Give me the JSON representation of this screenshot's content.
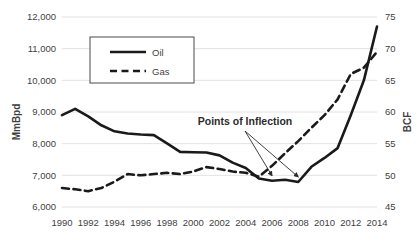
{
  "chart_data": {
    "type": "line",
    "title": "",
    "xlabel": "",
    "ylabel": "MmBpd",
    "y2label": "BCF",
    "grid": "horizontal",
    "legend_position": "upper-left-inside",
    "x": [
      1990,
      1991,
      1992,
      1993,
      1994,
      1995,
      1996,
      1997,
      1998,
      1999,
      2000,
      2001,
      2002,
      2003,
      2004,
      2005,
      2006,
      2007,
      2008,
      2009,
      2010,
      2011,
      2012,
      2013,
      2014
    ],
    "xticks": [
      "1990",
      "1992",
      "1994",
      "1996",
      "1998",
      "2000",
      "2002",
      "2004",
      "2006",
      "2008",
      "2010",
      "2012",
      "2014"
    ],
    "xlim": [
      1990,
      2014
    ],
    "ylim": [
      6000,
      12000
    ],
    "yticks": [
      "6,000",
      "7,000",
      "8,000",
      "9,000",
      "10,000",
      "11,000",
      "12,000"
    ],
    "y2lim": [
      45,
      75
    ],
    "y2ticks": [
      "45",
      "50",
      "55",
      "60",
      "65",
      "70",
      "75"
    ],
    "series": [
      {
        "name": "Oil",
        "style": "solid",
        "axis": "left",
        "color": "#1a1a1a",
        "values": [
          8900,
          9100,
          8860,
          8580,
          8390,
          8320,
          8290,
          8270,
          8010,
          7740,
          7730,
          7720,
          7630,
          7400,
          7230,
          6900,
          6830,
          6860,
          6790,
          7270,
          7550,
          7860,
          8900,
          10000,
          11700
        ]
      },
      {
        "name": "Gas",
        "style": "dashed",
        "axis": "right",
        "color": "#1a1a1a",
        "values": [
          48.0,
          47.8,
          47.5,
          48.0,
          49.0,
          50.2,
          50.0,
          50.2,
          50.4,
          50.2,
          50.6,
          51.3,
          51.0,
          50.6,
          50.4,
          49.8,
          51.5,
          53.5,
          55.4,
          57.5,
          59.5,
          62.0,
          66.0,
          67.0,
          69.5
        ]
      }
    ],
    "annotations": [
      {
        "text": "Points of Inflection",
        "points": [
          2006,
          2008
        ]
      }
    ]
  },
  "legend": {
    "items": [
      {
        "label": "Oil"
      },
      {
        "label": "Gas"
      }
    ]
  },
  "axes": {
    "left_title": "MmBpd",
    "right_title": "BCF"
  }
}
